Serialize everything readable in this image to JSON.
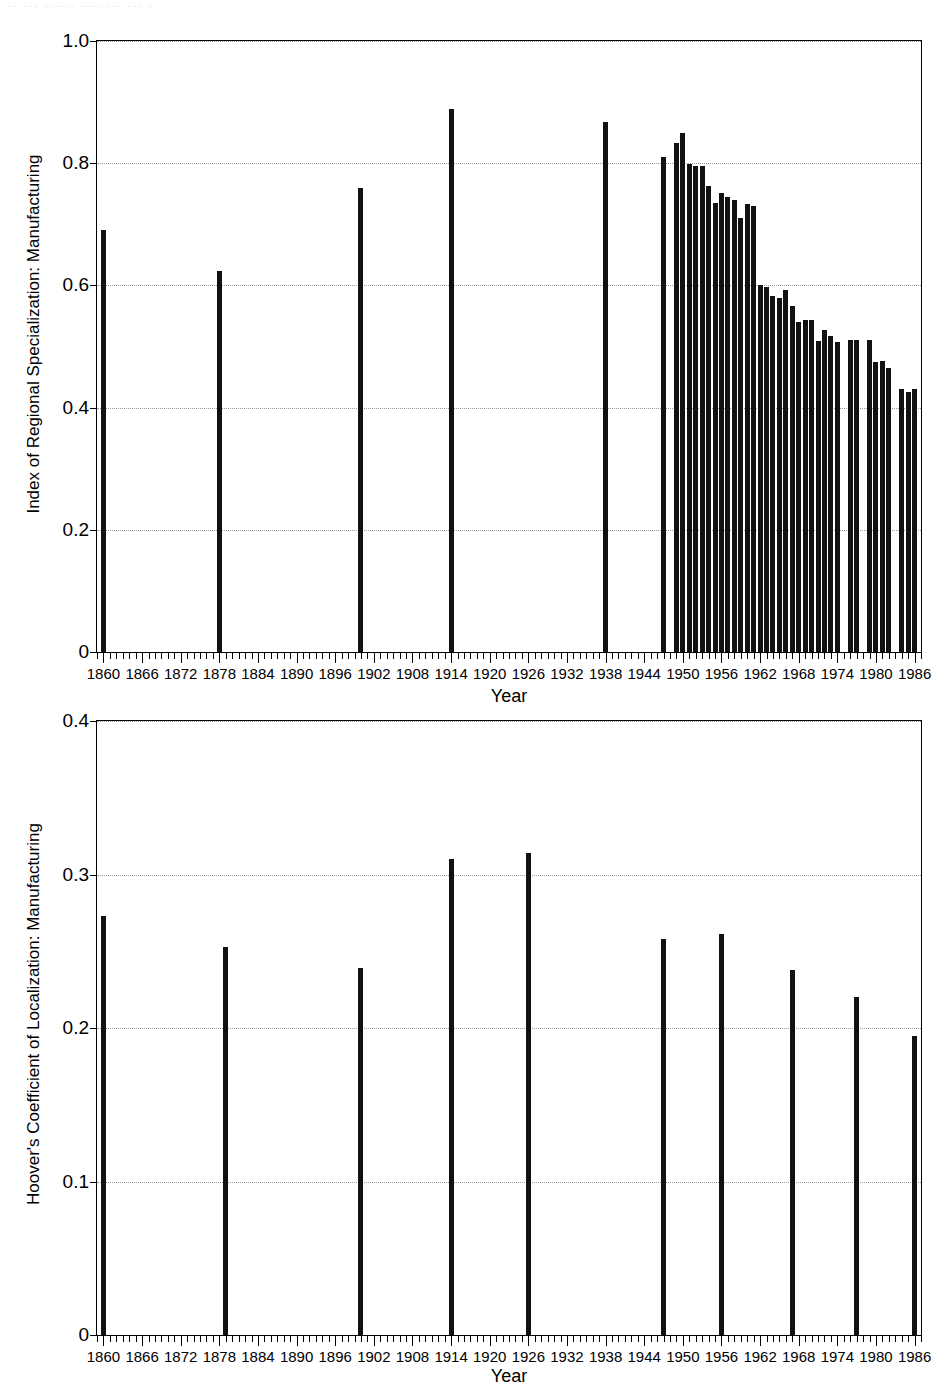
{
  "header": {
    "faint_text": "-- --- ------ ---- ---  --- -"
  },
  "axis": {
    "xlabel": "Year",
    "xtick_labels": [
      "1860",
      "1866",
      "1872",
      "1878",
      "1884",
      "1890",
      "1896",
      "1902",
      "1908",
      "1914",
      "1920",
      "1926",
      "1932",
      "1938",
      "1944",
      "1950",
      "1956",
      "1962",
      "1968",
      "1974",
      "1980",
      "1986"
    ],
    "xlim": [
      1859,
      1987
    ]
  },
  "chart_data": [
    {
      "id": "top",
      "type": "bar",
      "title": "",
      "xlabel": "Year",
      "ylabel": "Index of Regional Specialization: Manufacturing",
      "xlim": [
        1859,
        1987
      ],
      "ylim": [
        0,
        1.0
      ],
      "ytick_labels": [
        "0",
        "0.2",
        "0.4",
        "0.6",
        "0.8",
        "1.0"
      ],
      "ytick_values": [
        0,
        0.2,
        0.4,
        0.6,
        0.8,
        1.0
      ],
      "grid": "horizontal-dotted",
      "legend": "none",
      "categories": [
        1860,
        1878,
        1900,
        1914,
        1938,
        1947,
        1949,
        1950,
        1951,
        1952,
        1953,
        1954,
        1955,
        1956,
        1957,
        1958,
        1959,
        1960,
        1961,
        1962,
        1963,
        1964,
        1965,
        1966,
        1967,
        1968,
        1969,
        1970,
        1971,
        1972,
        1973,
        1974,
        1976,
        1977,
        1979,
        1980,
        1981,
        1982,
        1984,
        1985,
        1986
      ],
      "values": [
        0.69,
        0.623,
        0.76,
        0.888,
        0.868,
        0.81,
        0.833,
        0.849,
        0.799,
        0.796,
        0.795,
        0.762,
        0.735,
        0.752,
        0.745,
        0.74,
        0.711,
        0.733,
        0.73,
        0.601,
        0.597,
        0.583,
        0.58,
        0.592,
        0.566,
        0.54,
        0.543,
        0.543,
        0.509,
        0.527,
        0.518,
        0.507,
        0.51,
        0.511,
        0.511,
        0.474,
        0.477,
        0.465,
        0.43,
        0.426,
        0.43
      ]
    },
    {
      "id": "bottom",
      "type": "bar",
      "title": "",
      "xlabel": "Year",
      "ylabel": "Hoover's Coefficient of Localization: Manufacturing",
      "xlim": [
        1859,
        1987
      ],
      "ylim": [
        0,
        0.4
      ],
      "ytick_labels": [
        "0",
        "0.1",
        "0.2",
        "0.3",
        "0.4"
      ],
      "ytick_values": [
        0,
        0.1,
        0.2,
        0.3,
        0.4
      ],
      "grid": "horizontal-dotted",
      "legend": "none",
      "categories": [
        1860,
        1879,
        1900,
        1914,
        1926,
        1947,
        1956,
        1967,
        1977,
        1986
      ],
      "values": [
        0.273,
        0.253,
        0.239,
        0.31,
        0.314,
        0.258,
        0.261,
        0.238,
        0.22,
        0.195
      ]
    }
  ]
}
